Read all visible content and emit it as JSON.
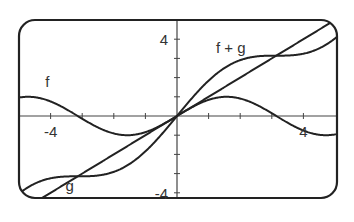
{
  "chart_data": {
    "type": "line",
    "title": "",
    "xlabel": "",
    "ylabel": "",
    "xlim": [
      -5,
      5
    ],
    "ylim": [
      -4.3,
      5
    ],
    "grid": false,
    "x_tick_step": 1,
    "y_tick_step": 1,
    "tick_labels": {
      "x": [
        {
          "value": -4,
          "label": "-4"
        },
        {
          "value": 4,
          "label": "4"
        }
      ],
      "y": [
        {
          "value": 4,
          "label": "4"
        },
        {
          "value": -4,
          "label": "-4"
        }
      ]
    },
    "series": [
      {
        "name": "f",
        "expression": "sin(x)",
        "label": "f",
        "label_pos": [
          -4.1,
          1.5
        ]
      },
      {
        "name": "g",
        "expression": "x",
        "label": "g",
        "label_pos": [
          -3.4,
          -3.9
        ]
      },
      {
        "name": "f + g",
        "expression": "x + sin(x)",
        "label": "f + g",
        "label_pos": [
          1.7,
          3.3
        ]
      }
    ],
    "sample_points": {
      "x": [
        -5,
        -4,
        -3,
        -2,
        -1,
        0,
        1,
        2,
        3,
        4,
        5
      ],
      "f": [
        0.96,
        0.76,
        -0.14,
        -0.91,
        -0.84,
        0,
        0.84,
        0.91,
        0.14,
        -0.76,
        -0.96
      ],
      "g": [
        -5,
        -4,
        -3,
        -2,
        -1,
        0,
        1,
        2,
        3,
        4,
        5
      ],
      "f_plus_g": [
        -4.04,
        -3.24,
        -3.14,
        -2.91,
        -1.84,
        0,
        1.84,
        2.91,
        3.14,
        3.24,
        4.04
      ]
    },
    "colors": {
      "curve": "#222222",
      "axis": "#444444",
      "frame": "#222222"
    }
  }
}
